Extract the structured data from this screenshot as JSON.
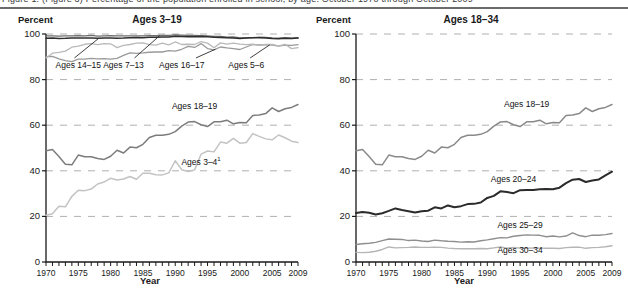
{
  "header": {
    "clipped_caption": "Figure 1. (Figure 3) Percentage of the population enrolled in school, by age: October 1970 through October 2009"
  },
  "chart_data": [
    {
      "type": "line",
      "title": "Ages 3–19",
      "ylabel": "Percent",
      "xlabel": "Year",
      "ylim": [
        0,
        100
      ],
      "yticks": [
        0,
        20,
        40,
        60,
        80,
        100
      ],
      "xlim": [
        1970,
        2009
      ],
      "xticks": [
        1970,
        1975,
        1980,
        1985,
        1990,
        1995,
        2000,
        2005,
        2009
      ],
      "grid": "horizontal-dashed",
      "legend_position": "inline-annotations",
      "x": [
        1970,
        1971,
        1972,
        1973,
        1974,
        1975,
        1976,
        1977,
        1978,
        1979,
        1980,
        1981,
        1982,
        1983,
        1984,
        1985,
        1986,
        1987,
        1988,
        1989,
        1990,
        1991,
        1992,
        1993,
        1994,
        1995,
        1996,
        1997,
        1998,
        1999,
        2000,
        2001,
        2002,
        2003,
        2004,
        2005,
        2006,
        2007,
        2008,
        2009
      ],
      "series": [
        {
          "name": "Ages 7–13",
          "color": "#6e6e6e",
          "width": 1.3,
          "label_x": 1982,
          "label_y": 86,
          "values": [
            99.2,
            99.2,
            99.1,
            99.2,
            99.2,
            99.3,
            99.2,
            99.4,
            99.1,
            99.2,
            99.3,
            99.2,
            99.2,
            99.2,
            99.2,
            99.2,
            99.3,
            99.3,
            99.4,
            99.4,
            99.6,
            99.5,
            99.4,
            99.4,
            99.3,
            99.2,
            99.0,
            98.9,
            98.6,
            98.7,
            98.3,
            98.3,
            98.4,
            98.6,
            98.5,
            98.3,
            98.2,
            98.4,
            98.2,
            98.4
          ]
        },
        {
          "name": "Ages 14–15",
          "color": "#2f2f2f",
          "width": 1.5,
          "label_x": 1975,
          "label_y": 86,
          "values": [
            98.1,
            98.2,
            98.0,
            98.1,
            98.3,
            98.2,
            98.3,
            98.3,
            98.1,
            98.2,
            98.2,
            98.1,
            98.2,
            98.4,
            98.5,
            98.4,
            98.6,
            98.6,
            98.7,
            98.7,
            99.0,
            98.9,
            98.8,
            98.8,
            98.9,
            98.8,
            98.6,
            98.5,
            98.4,
            98.3,
            98.0,
            98.2,
            98.4,
            98.4,
            98.2,
            98.0,
            97.9,
            98.1,
            98.0,
            98.2
          ]
        },
        {
          "name": "Ages 16–17",
          "color": "#9a9a9a",
          "width": 1.3,
          "label_x": 1991,
          "label_y": 86,
          "values": [
            90.0,
            90.2,
            89.1,
            88.3,
            87.9,
            89.0,
            89.0,
            89.3,
            89.1,
            89.2,
            89.0,
            89.3,
            90.6,
            91.7,
            91.5,
            91.7,
            92.0,
            92.1,
            92.1,
            92.7,
            92.5,
            93.3,
            94.6,
            94.1,
            95.8,
            93.6,
            93.0,
            94.3,
            93.9,
            93.6,
            93.2,
            94.3,
            95.4,
            95.2,
            95.2,
            95.1,
            94.7,
            95.1,
            95.0,
            95.3
          ]
        },
        {
          "name": "Ages 5–6",
          "color": "#b9b9b9",
          "width": 1.3,
          "label_x": 2001,
          "label_y": 86,
          "values": [
            89.5,
            91.6,
            91.9,
            92.5,
            94.2,
            94.7,
            95.5,
            95.8,
            95.3,
            95.8,
            95.7,
            94.0,
            95.0,
            95.4,
            96.0,
            96.1,
            95.3,
            95.1,
            96.0,
            95.2,
            96.5,
            95.4,
            95.5,
            95.4,
            96.7,
            96.0,
            94.0,
            96.1,
            95.6,
            96.0,
            95.6,
            95.3,
            95.5,
            95.0,
            95.4,
            95.4,
            94.8,
            95.5,
            93.6,
            94.0
          ]
        },
        {
          "name": "Ages 18–19",
          "color": "#7c7c7c",
          "width": 1.5,
          "label_x": 1993,
          "label_y": 68,
          "values": [
            48.8,
            49.3,
            46.3,
            42.9,
            42.6,
            46.9,
            46.2,
            46.2,
            45.4,
            45.0,
            46.4,
            49.0,
            47.8,
            50.4,
            50.1,
            51.6,
            54.6,
            55.6,
            55.6,
            56.0,
            57.2,
            59.6,
            61.4,
            61.6,
            60.2,
            59.4,
            61.5,
            61.5,
            62.2,
            60.6,
            61.2,
            61.1,
            64.3,
            64.5,
            65.1,
            67.6,
            66.0,
            67.2,
            67.8,
            69.1
          ]
        },
        {
          "name": "Ages 3–4",
          "footnote": "1",
          "color": "#c3c3c3",
          "width": 1.5,
          "label_x": 1994,
          "label_y": 44,
          "values": [
            20.5,
            21.2,
            24.4,
            24.2,
            28.8,
            31.5,
            31.3,
            32.0,
            34.2,
            35.1,
            36.7,
            36.0,
            36.4,
            37.5,
            36.3,
            38.9,
            38.9,
            38.3,
            38.2,
            39.1,
            44.4,
            40.5,
            39.7,
            40.4,
            47.3,
            48.7,
            48.3,
            52.6,
            52.1,
            54.2,
            52.1,
            52.4,
            56.3,
            55.1,
            54.0,
            53.6,
            55.7,
            54.5,
            53.0,
            52.4
          ]
        }
      ]
    },
    {
      "type": "line",
      "title": "Ages 18–34",
      "ylabel": "Percent",
      "xlabel": "Year",
      "ylim": [
        0,
        100
      ],
      "yticks": [
        0,
        20,
        40,
        60,
        80,
        100
      ],
      "xlim": [
        1970,
        2009
      ],
      "xticks": [
        1970,
        1975,
        1980,
        1985,
        1990,
        1995,
        2000,
        2005,
        2009
      ],
      "grid": "horizontal-dashed",
      "legend_position": "inline-annotations",
      "x": [
        1970,
        1971,
        1972,
        1973,
        1974,
        1975,
        1976,
        1977,
        1978,
        1979,
        1980,
        1981,
        1982,
        1983,
        1984,
        1985,
        1986,
        1987,
        1988,
        1989,
        1990,
        1991,
        1992,
        1993,
        1994,
        1995,
        1996,
        1997,
        1998,
        1999,
        2000,
        2001,
        2002,
        2003,
        2004,
        2005,
        2006,
        2007,
        2008,
        2009
      ],
      "series": [
        {
          "name": "Ages 18–19",
          "color": "#8a8a8a",
          "width": 1.5,
          "label_x": 1996,
          "label_y": 69,
          "values": [
            48.8,
            49.3,
            46.3,
            42.9,
            42.6,
            46.9,
            46.2,
            46.2,
            45.4,
            45.0,
            46.4,
            49.0,
            47.8,
            50.4,
            50.1,
            51.6,
            54.6,
            55.6,
            55.6,
            56.0,
            57.2,
            59.6,
            61.4,
            61.6,
            60.2,
            59.4,
            61.5,
            61.5,
            62.2,
            60.6,
            61.2,
            61.1,
            64.3,
            64.5,
            65.1,
            67.6,
            66.0,
            67.2,
            67.8,
            69.1
          ]
        },
        {
          "name": "Ages 20–24",
          "color": "#2b2b2b",
          "width": 2.0,
          "label_x": 1994,
          "label_y": 36,
          "values": [
            21.5,
            21.9,
            21.6,
            20.8,
            21.4,
            22.4,
            23.5,
            22.8,
            22.3,
            21.7,
            22.3,
            22.5,
            24.0,
            23.5,
            24.8,
            24.0,
            24.5,
            25.4,
            25.5,
            26.1,
            28.1,
            29.0,
            31.0,
            30.7,
            30.2,
            31.5,
            31.6,
            31.6,
            31.9,
            32.0,
            31.9,
            32.6,
            34.6,
            36.1,
            36.4,
            35.1,
            35.7,
            36.2,
            38.0,
            39.6
          ]
        },
        {
          "name": "Ages 25–29",
          "color": "#8f8f8f",
          "width": 1.4,
          "label_x": 1995,
          "label_y": 16,
          "values": [
            7.7,
            8.0,
            8.2,
            8.6,
            9.4,
            10.1,
            10.0,
            9.9,
            9.4,
            9.6,
            9.2,
            9.0,
            9.6,
            9.3,
            9.1,
            9.0,
            8.7,
            8.9,
            8.8,
            9.3,
            9.7,
            10.2,
            10.7,
            10.6,
            11.3,
            11.6,
            11.9,
            11.8,
            11.7,
            11.1,
            11.4,
            11.0,
            11.4,
            12.8,
            11.6,
            11.1,
            11.8,
            11.7,
            12.0,
            12.5
          ]
        },
        {
          "name": "Ages 30–34",
          "color": "#b5b5b5",
          "width": 1.4,
          "label_x": 1995,
          "label_y": 5,
          "values": [
            4.2,
            4.1,
            4.3,
            4.7,
            5.5,
            6.6,
            6.2,
            6.3,
            6.4,
            6.6,
            6.4,
            6.4,
            6.5,
            6.4,
            6.1,
            5.9,
            5.8,
            5.8,
            5.8,
            5.9,
            5.8,
            6.2,
            6.6,
            6.1,
            6.4,
            6.1,
            6.0,
            6.2,
            6.1,
            6.0,
            6.0,
            5.9,
            6.3,
            6.5,
            6.5,
            6.0,
            6.3,
            6.4,
            6.7,
            7.1
          ]
        }
      ]
    }
  ],
  "footnote_marker": "1"
}
